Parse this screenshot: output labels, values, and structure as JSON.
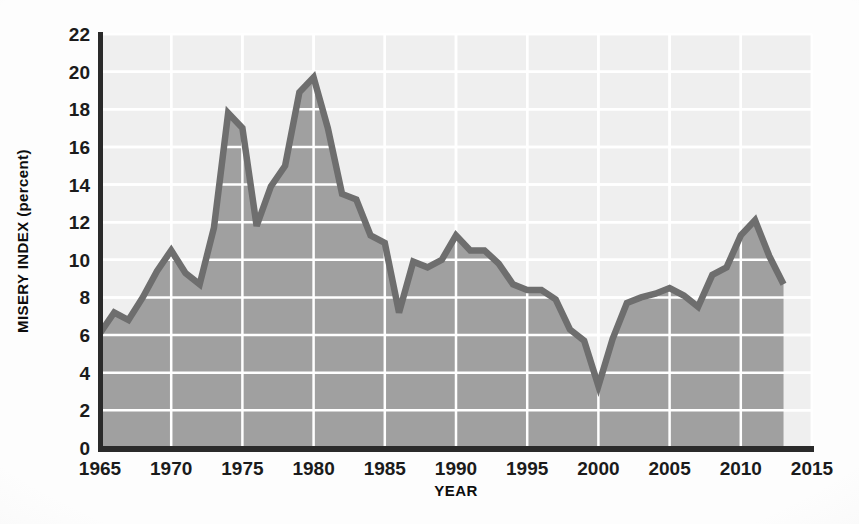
{
  "chart_data": {
    "type": "area",
    "title": "",
    "subtitle": "",
    "xlabel": "YEAR",
    "ylabel": "MISERY INDEX (percent)",
    "xlim": [
      1965,
      2015
    ],
    "ylim": [
      0,
      22
    ],
    "xticks": [
      1965,
      1970,
      1975,
      1980,
      1985,
      1990,
      1995,
      2000,
      2005,
      2010,
      2015
    ],
    "yticks": [
      0,
      2,
      4,
      6,
      8,
      10,
      12,
      14,
      16,
      18,
      20,
      22
    ],
    "xtick_labels": [
      "1965",
      "1970",
      "1975",
      "1980",
      "1985",
      "1990",
      "1995",
      "2000",
      "2005",
      "2010",
      "2015"
    ],
    "ytick_labels": [
      "0",
      "2",
      "4",
      "6",
      "8",
      "10",
      "12",
      "14",
      "16",
      "18",
      "20",
      "22"
    ],
    "grid": true,
    "legend": "none",
    "annotations": [],
    "series": [
      {
        "name": "Misery Index",
        "line_color": "#6e6e6e",
        "fill_color": "#a0a0a0",
        "x": [
          1965,
          1966,
          1967,
          1968,
          1969,
          1970,
          1971,
          1972,
          1973,
          1974,
          1975,
          1976,
          1977,
          1978,
          1979,
          1980,
          1981,
          1982,
          1983,
          1984,
          1985,
          1986,
          1987,
          1988,
          1989,
          1990,
          1991,
          1992,
          1993,
          1994,
          1995,
          1996,
          1997,
          1998,
          1999,
          2000,
          2001,
          2002,
          2003,
          2004,
          2005,
          2006,
          2007,
          2008,
          2009,
          2010,
          2011,
          2012,
          2013
        ],
        "values": [
          6.1,
          7.2,
          6.8,
          8.0,
          9.4,
          10.5,
          9.3,
          8.7,
          11.7,
          17.8,
          17.0,
          11.8,
          13.9,
          15.0,
          18.9,
          19.7,
          17.0,
          13.5,
          13.2,
          11.3,
          10.9,
          7.2,
          9.9,
          9.6,
          10.0,
          11.3,
          10.5,
          10.5,
          9.8,
          8.7,
          8.4,
          8.4,
          7.9,
          6.3,
          5.7,
          3.3,
          5.8,
          7.7,
          8.0,
          8.2,
          8.5,
          8.1,
          7.5,
          9.2,
          9.6,
          11.3,
          12.1,
          10.2,
          8.7
        ]
      }
    ]
  }
}
